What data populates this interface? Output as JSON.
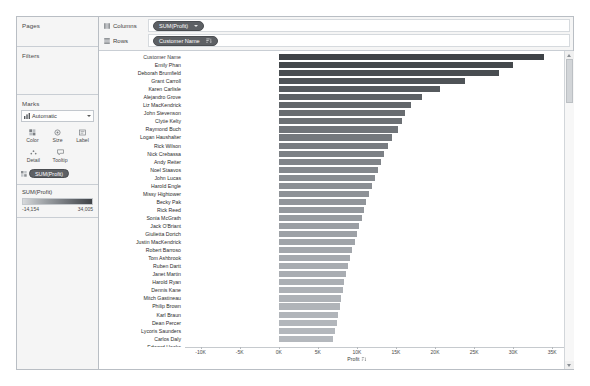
{
  "cards": {
    "pages": {
      "title": "Pages"
    },
    "filters": {
      "title": "Filters"
    },
    "marks": {
      "title": "Marks",
      "mark_type": "Automatic",
      "mark_type_icon": "bar-mark-icon",
      "buttons": [
        {
          "label": "Color",
          "icon": "color-icon"
        },
        {
          "label": "Size",
          "icon": "size-icon"
        },
        {
          "label": "Label",
          "icon": "label-icon"
        },
        {
          "label": "Detail",
          "icon": "detail-icon"
        },
        {
          "label": "Tooltip",
          "icon": "tooltip-icon"
        }
      ],
      "pill": "SUM(Profit)"
    },
    "legend": {
      "title": "SUM(Profit)",
      "min": "-14,154",
      "max": "34,005",
      "ramp_from": "#d7d9db",
      "ramp_to": "#3f4347"
    }
  },
  "shelves": [
    {
      "label": "Columns",
      "icon": "columns-icon",
      "pill": "SUM(Profit)",
      "pill_kind": "measure"
    },
    {
      "label": "Rows",
      "icon": "rows-icon",
      "pill": "Customer Name",
      "pill_kind": "dimension",
      "sorted": true
    }
  ],
  "axis": {
    "title": "Profit",
    "sort_icon": "sort-desc-icon",
    "ticks": [
      {
        "label": "-10K",
        "value": -10000
      },
      {
        "label": "-5K",
        "value": -5000
      },
      {
        "label": "0K",
        "value": 0
      },
      {
        "label": "5K",
        "value": 5000
      },
      {
        "label": "10K",
        "value": 10000
      },
      {
        "label": "15K",
        "value": 15000
      },
      {
        "label": "20K",
        "value": 20000
      },
      {
        "label": "25K",
        "value": 25000
      },
      {
        "label": "30K",
        "value": 30000
      },
      {
        "label": "35K",
        "value": 35000
      }
    ]
  },
  "row_header_title": "Customer Name",
  "scrollbar": {
    "up_icon": "caret-up-icon",
    "down_icon": "caret-down-icon",
    "thumb": "scroll-thumb"
  },
  "chart_data": {
    "type": "bar",
    "orientation": "horizontal",
    "xlabel": "Profit",
    "ylabel": "Customer Name",
    "xlim": [
      -12000,
      36500
    ],
    "grid": false,
    "legend": "color encodes SUM(Profit)",
    "categories": [
      "Emily Phan",
      "Deborah Brumfield",
      "Grant Carroll",
      "Karen Carlisle",
      "Alejandro Grove",
      "Liz MacKendrick",
      "John Stevenson",
      "Clytie Kelty",
      "Raymond Buch",
      "Logan Haushalter",
      "Rick Wilson",
      "Nick Crebassa",
      "Andy Reiter",
      "Noel Staavos",
      "John Lucas",
      "Harold Engle",
      "Missy Hightower",
      "Becky Pak",
      "Rick Reed",
      "Sonia McGrath",
      "Jack O'Briant",
      "Giulietta Dortch",
      "Justin MacKendrick",
      "Robert Barroso",
      "Tom Ashbrook",
      "Ruben Dartt",
      "Janet Martin",
      "Harold Ryan",
      "Dennis Kane",
      "Mitch Gastineau",
      "Philip Brown",
      "Karl Braun",
      "Dean Percer",
      "Lycoris Saunders",
      "Carlos Daly",
      "Edward Hooks"
    ],
    "values": [
      34005,
      30000,
      28200,
      23800,
      20600,
      18300,
      16900,
      16200,
      15800,
      15200,
      14500,
      14000,
      13500,
      13100,
      12700,
      12300,
      11900,
      11500,
      11200,
      10900,
      10600,
      10300,
      10000,
      9700,
      9400,
      9100,
      8800,
      8600,
      8400,
      8200,
      8000,
      7800,
      7600,
      7400,
      7200,
      7000
    ],
    "colors": [
      "#3f4347",
      "#44484c",
      "#494d51",
      "#4f5357",
      "#565a5e",
      "#5d6165",
      "#63676b",
      "#686c70",
      "#6c7074",
      "#707479",
      "#74787d",
      "#787c81",
      "#7c8085",
      "#808489",
      "#84888d",
      "#888c91",
      "#8b8f94",
      "#8e9297",
      "#91959a",
      "#94989d",
      "#979ba0",
      "#9a9ea3",
      "#9da1a6",
      "#a0a4a9",
      "#a3a7ac",
      "#a5a9ae",
      "#a7abb0",
      "#a9adb2",
      "#abafb4",
      "#adb1b6",
      "#aeb2b7",
      "#b0b4b9",
      "#b1b5ba",
      "#b2b6bb",
      "#b3b7bc",
      "#b4b8bd"
    ]
  }
}
